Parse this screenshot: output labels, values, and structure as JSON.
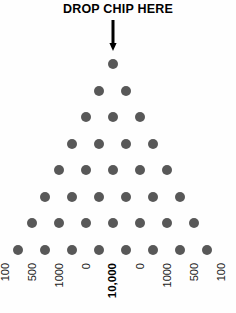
{
  "board": {
    "title": "DROP CHIP HERE",
    "arrow_icon": "down-arrow-icon",
    "peg_color": "#585858",
    "background_color": "#fefefe",
    "text_color": "#000000"
  },
  "pegs": {
    "rows": 8,
    "counts": [
      1,
      2,
      3,
      4,
      5,
      6,
      7,
      8
    ],
    "dot_diameter_px": 10,
    "row_spacing_px": 26.5,
    "column_spacing_px": 27
  },
  "prizes": {
    "slots": [
      {
        "label": "100",
        "jackpot": false
      },
      {
        "label": "500",
        "jackpot": false
      },
      {
        "label": "1000",
        "jackpot": false
      },
      {
        "label": "0",
        "jackpot": false
      },
      {
        "label": "10,000",
        "jackpot": true
      },
      {
        "label": "0",
        "jackpot": false
      },
      {
        "label": "1000",
        "jackpot": false
      },
      {
        "label": "500",
        "jackpot": false
      },
      {
        "label": "100",
        "jackpot": false
      }
    ]
  }
}
